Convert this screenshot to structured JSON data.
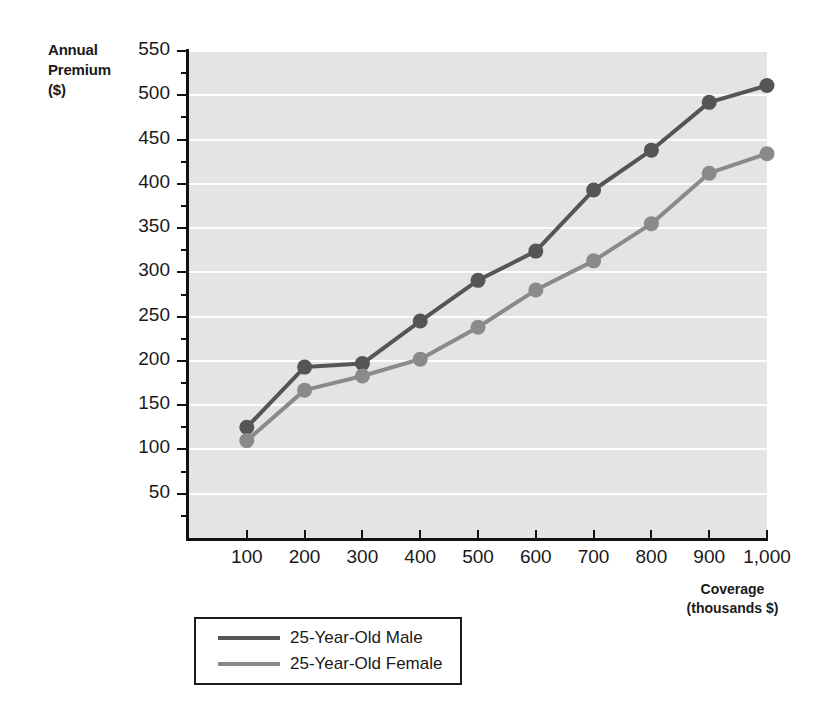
{
  "axes": {
    "y_title_lines": [
      "Annual",
      "Premium",
      "($)"
    ],
    "x_title_lines": [
      "Coverage",
      "(thousands $)"
    ],
    "y_ticks": [
      "50",
      "100",
      "150",
      "200",
      "250",
      "300",
      "350",
      "400",
      "450",
      "500",
      "550"
    ],
    "x_ticks": [
      "100",
      "200",
      "300",
      "400",
      "500",
      "600",
      "700",
      "800",
      "900",
      "1,000"
    ]
  },
  "legend": {
    "items": [
      {
        "label": "25-Year-Old Male",
        "color": "#555555"
      },
      {
        "label": "25-Year-Old Female",
        "color": "#8a8a8a"
      }
    ]
  },
  "colors": {
    "plot_background": "#e4e4e4",
    "gridline": "#fdfdfd",
    "axis": "#111111",
    "male": "#555555",
    "female": "#8a8a8a"
  },
  "chart_data": {
    "type": "line",
    "title": "",
    "xlabel": "Coverage (thousands $)",
    "ylabel": "Annual Premium ($)",
    "xlim": [
      0,
      1000
    ],
    "ylim": [
      0,
      550
    ],
    "ytick_interval": 50,
    "yminortick_interval": 25,
    "xtick_interval": 100,
    "grid": "horizontal",
    "legend_position": "below-left",
    "markers": "filled-circle",
    "x": [
      100,
      200,
      300,
      400,
      500,
      600,
      700,
      800,
      900,
      1000
    ],
    "series": [
      {
        "name": "25-Year-Old Male",
        "color": "#555555",
        "values": [
          125,
          193,
          197,
          245,
          291,
          324,
          393,
          438,
          492,
          511
        ]
      },
      {
        "name": "25-Year-Old Female",
        "color": "#8a8a8a",
        "values": [
          110,
          167,
          183,
          202,
          238,
          280,
          313,
          355,
          412,
          434
        ]
      }
    ]
  }
}
